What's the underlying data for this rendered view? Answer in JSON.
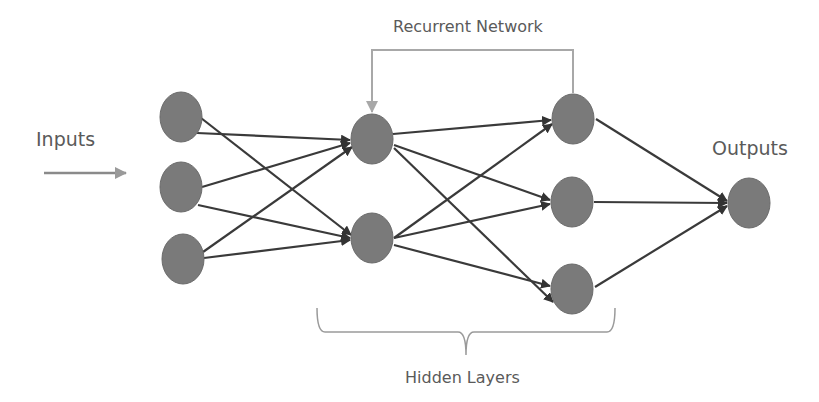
{
  "diagram": {
    "labels": {
      "inputs": "Inputs",
      "outputs": "Outputs",
      "recurrent": "Recurrent Network",
      "hidden": "Hidden Layers"
    },
    "layers": [
      {
        "name": "input",
        "nodes": 3
      },
      {
        "name": "hidden-1",
        "nodes": 2
      },
      {
        "name": "hidden-2",
        "nodes": 3
      },
      {
        "name": "output",
        "nodes": 1
      }
    ],
    "connections": "fully connected between adjacent layers",
    "recurrent_connection": {
      "from": "hidden-2 node 1",
      "to": "hidden-1 node 1"
    },
    "colors": {
      "node_fill": "#7a7a7a",
      "edge": "#3a3a3a",
      "recurrent_edge": "#a8a8a8",
      "input_arrow": "#8a8a8a",
      "bracket": "#9a9a9a",
      "text": "#5a5a5a"
    }
  }
}
